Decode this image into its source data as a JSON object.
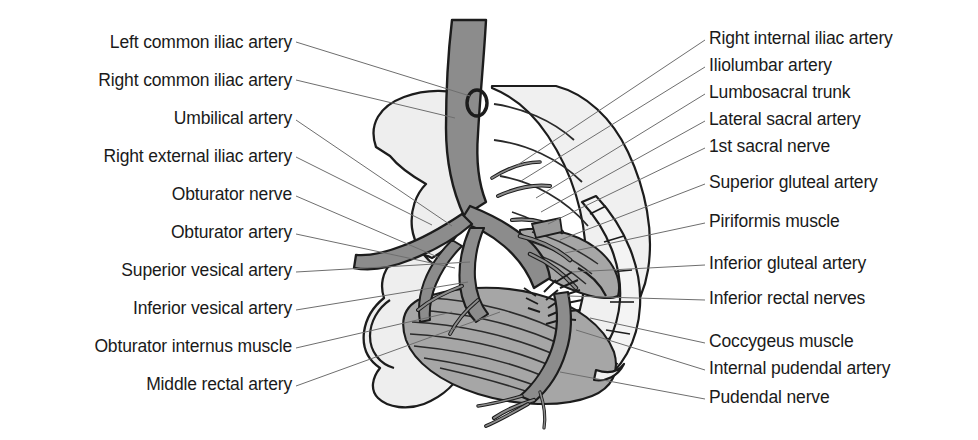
{
  "figure": {
    "width": 978,
    "height": 440,
    "background": "#ffffff"
  },
  "colors": {
    "text": "#1a1a1a",
    "leader_line": "#6e6e6e",
    "outline": "#1c1c1c",
    "bone_fill": "#eeeeee",
    "bone_fill_shadow": "#e2e2e2",
    "artery_fill": "#8c8c8c",
    "artery_fill_dark": "#7b7b7b",
    "muscle_fill": "#a6a6a6",
    "muscle_fill_light": "#b4b4b4",
    "ligament_fill": "#f2f2f2"
  },
  "labels_left": [
    {
      "id": "left-common-iliac-artery",
      "text": "Left common iliac artery",
      "x": 292,
      "y": 47,
      "lx1": 296,
      "ly1": 42,
      "lx2": 470,
      "ly2": 96
    },
    {
      "id": "right-common-iliac-artery",
      "text": "Right common iliac artery",
      "x": 292,
      "y": 85,
      "lx1": 296,
      "ly1": 80,
      "lx2": 455,
      "ly2": 118
    },
    {
      "id": "umbilical-artery",
      "text": "Umbilical artery",
      "x": 292,
      "y": 123,
      "lx1": 296,
      "ly1": 120,
      "lx2": 452,
      "ly2": 226
    },
    {
      "id": "right-external-iliac-artery",
      "text": "Right external iliac artery",
      "x": 292,
      "y": 161,
      "lx1": 296,
      "ly1": 157,
      "lx2": 432,
      "ly2": 225
    },
    {
      "id": "obturator-nerve",
      "text": "Obturator nerve",
      "x": 292,
      "y": 199,
      "lx1": 296,
      "ly1": 196,
      "lx2": 440,
      "ly2": 258
    },
    {
      "id": "obturator-artery",
      "text": "Obturator artery",
      "x": 292,
      "y": 237,
      "lx1": 296,
      "ly1": 234,
      "lx2": 455,
      "ly2": 268
    },
    {
      "id": "superior-vesical-artery",
      "text": "Superior vesical artery",
      "x": 292,
      "y": 275,
      "lx1": 296,
      "ly1": 272,
      "lx2": 470,
      "ly2": 262
    },
    {
      "id": "inferior-vesical-artery",
      "text": "Inferior vesical artery",
      "x": 292,
      "y": 313,
      "lx1": 296,
      "ly1": 310,
      "lx2": 468,
      "ly2": 282
    },
    {
      "id": "obturator-internus-muscle",
      "text": "Obturator internus muscle",
      "x": 292,
      "y": 351,
      "lx1": 296,
      "ly1": 348,
      "lx2": 452,
      "ly2": 312
    },
    {
      "id": "middle-rectal-artery",
      "text": "Middle rectal artery",
      "x": 292,
      "y": 389,
      "lx1": 296,
      "ly1": 386,
      "lx2": 500,
      "ly2": 312
    }
  ],
  "labels_right": [
    {
      "id": "right-internal-iliac-artery",
      "text": "Right internal iliac artery",
      "x": 709,
      "y": 43,
      "lx1": 705,
      "ly1": 40,
      "lx2": 516,
      "ly2": 166
    },
    {
      "id": "iliolumbar-artery",
      "text": "Iliolumbar artery",
      "x": 709,
      "y": 70,
      "lx1": 705,
      "ly1": 67,
      "lx2": 521,
      "ly2": 181
    },
    {
      "id": "lumbosacral-trunk",
      "text": "Lumbosacral trunk",
      "x": 709,
      "y": 97,
      "lx1": 705,
      "ly1": 94,
      "lx2": 536,
      "ly2": 198
    },
    {
      "id": "lateral-sacral-artery",
      "text": "Lateral sacral artery",
      "x": 709,
      "y": 124,
      "lx1": 705,
      "ly1": 121,
      "lx2": 541,
      "ly2": 212
    },
    {
      "id": "1st-sacral-nerve",
      "text": "1st sacral nerve",
      "x": 709,
      "y": 151,
      "lx1": 705,
      "ly1": 148,
      "lx2": 548,
      "ly2": 224
    },
    {
      "id": "superior-gluteal-artery",
      "text": "Superior gluteal artery",
      "x": 709,
      "y": 187,
      "lx1": 705,
      "ly1": 184,
      "lx2": 560,
      "ly2": 240
    },
    {
      "id": "piriformis-muscle",
      "text": "Piriformis muscle",
      "x": 709,
      "y": 226,
      "lx1": 705,
      "ly1": 223,
      "lx2": 565,
      "ly2": 253
    },
    {
      "id": "inferior-gluteal-artery",
      "text": "Inferior gluteal artery",
      "x": 709,
      "y": 268,
      "lx1": 705,
      "ly1": 265,
      "lx2": 572,
      "ly2": 272
    },
    {
      "id": "inferior-rectal-nerves",
      "text": "Inferior rectal nerves",
      "x": 709,
      "y": 303,
      "lx1": 705,
      "ly1": 300,
      "lx2": 568,
      "ly2": 296
    },
    {
      "id": "coccygeus-muscle",
      "text": "Coccygeus muscle",
      "x": 709,
      "y": 346,
      "lx1": 705,
      "ly1": 343,
      "lx2": 590,
      "ly2": 318
    },
    {
      "id": "internal-pudendal-artery",
      "text": "Internal pudendal artery",
      "x": 709,
      "y": 373,
      "lx1": 705,
      "ly1": 370,
      "lx2": 576,
      "ly2": 330
    },
    {
      "id": "pudendal-nerve",
      "text": "Pudendal nerve",
      "x": 709,
      "y": 402,
      "lx1": 705,
      "ly1": 399,
      "lx2": 560,
      "ly2": 372
    }
  ]
}
